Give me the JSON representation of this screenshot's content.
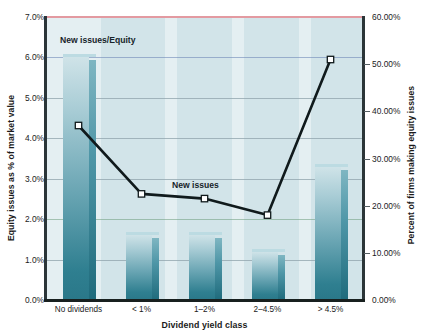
{
  "chart_data": {
    "type": "bar",
    "title": "",
    "subtitle": "",
    "xlabel": "Dividend yield class",
    "ylabel": "Equity issues as % of market value",
    "y2label": "Percent of firms making equity issues",
    "categories": [
      "No dividends",
      "< 1%",
      "1–2%",
      "2–4.5%",
      "> 4.5%"
    ],
    "ylim": [
      0,
      7
    ],
    "y2lim": [
      0,
      60
    ],
    "yticks": [
      "0.0%",
      "1.0%",
      "2.0%",
      "3.0%",
      "4.0%",
      "5.0%",
      "6.0%",
      "7.0%"
    ],
    "ytick_values": [
      0,
      1,
      2,
      3,
      4,
      5,
      6,
      7
    ],
    "y2ticks": [
      "0.00%",
      "10.00%",
      "20.00%",
      "30.00%",
      "40.00%",
      "50.00%",
      "60.00%"
    ],
    "y2tick_values": [
      0,
      10,
      20,
      30,
      40,
      50,
      60
    ],
    "grid": true,
    "legend_position": "inline-annotations",
    "series": [
      {
        "name": "New issues/Equity",
        "kind": "bar",
        "axis": "left",
        "unit": "%",
        "values": [
          6.0,
          1.6,
          1.6,
          1.2,
          3.3
        ],
        "annotation": "New issues/Equity"
      },
      {
        "name": "New issues",
        "kind": "line",
        "axis": "right",
        "unit": "%",
        "values": [
          37.0,
          22.5,
          21.5,
          18.0,
          51.0
        ],
        "annotation": "New issues"
      }
    ]
  },
  "colors": {
    "bar_top": "#cfe3e8",
    "bar_bottom": "#2a7889",
    "bar_side": "#1f6b7c",
    "plot_background": "#d2e4e9",
    "gridline": "#8fa3ab",
    "line_series": "#101a1c",
    "marker_fill": "#ffffff",
    "axis": "#2b3538",
    "text": "#1b1b1b"
  }
}
